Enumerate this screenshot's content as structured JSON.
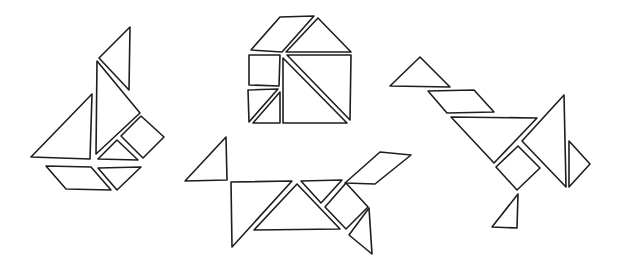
{
  "stroke_color": "#1e1e1e",
  "background_color": "#ffffff",
  "figures": [
    {
      "name": "sailboat",
      "label": "Sailboat",
      "pieces": [
        {
          "shape": "small-triangle",
          "role": "flag"
        },
        {
          "shape": "large-triangle",
          "role": "main-sail"
        },
        {
          "shape": "large-triangle",
          "role": "jib-sail"
        },
        {
          "shape": "square",
          "role": "side-square"
        },
        {
          "shape": "small-triangle",
          "role": "deck-triangle"
        },
        {
          "shape": "parallelogram",
          "role": "hull-left"
        },
        {
          "shape": "medium-triangle",
          "role": "hull-right"
        }
      ]
    },
    {
      "name": "house",
      "label": "House",
      "pieces": [
        {
          "shape": "parallelogram",
          "role": "roof-left"
        },
        {
          "shape": "medium-triangle",
          "role": "roof-right"
        },
        {
          "shape": "square",
          "role": "window"
        },
        {
          "shape": "small-triangle",
          "role": "door-left"
        },
        {
          "shape": "small-triangle",
          "role": "door-right"
        },
        {
          "shape": "large-triangle",
          "role": "wall-upper"
        },
        {
          "shape": "large-triangle",
          "role": "wall-lower"
        }
      ]
    },
    {
      "name": "fox",
      "label": "Fox",
      "pieces": [
        {
          "shape": "small-triangle",
          "role": "tail"
        },
        {
          "shape": "large-triangle",
          "role": "back-leg"
        },
        {
          "shape": "large-triangle",
          "role": "body"
        },
        {
          "shape": "small-triangle",
          "role": "neck"
        },
        {
          "shape": "square",
          "role": "chest"
        },
        {
          "shape": "parallelogram",
          "role": "head"
        },
        {
          "shape": "medium-triangle",
          "role": "front-leg"
        }
      ]
    },
    {
      "name": "crane",
      "label": "Crane",
      "pieces": [
        {
          "shape": "small-triangle",
          "role": "head"
        },
        {
          "shape": "parallelogram",
          "role": "neck"
        },
        {
          "shape": "large-triangle",
          "role": "body"
        },
        {
          "shape": "large-triangle",
          "role": "wing"
        },
        {
          "shape": "small-triangle",
          "role": "tail"
        },
        {
          "shape": "square",
          "role": "belly"
        },
        {
          "shape": "medium-triangle",
          "role": "foot"
        }
      ]
    }
  ]
}
